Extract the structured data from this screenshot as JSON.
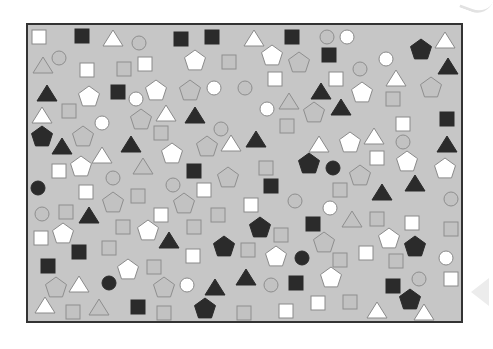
{
  "frame": {
    "x": 27,
    "y": 24,
    "width": 435,
    "height": 298,
    "background": "#c6c6c6",
    "border": "#333333"
  },
  "colors": {
    "black": "#2b2b2b",
    "gray": "#c2c2c2",
    "gray_stroke": "#8e8e8e",
    "white": "#ffffff",
    "white_stroke": "#8a8a8a"
  },
  "shapes": [
    {
      "t": "sq",
      "c": "white",
      "x": 39,
      "y": 37
    },
    {
      "t": "sq",
      "c": "black",
      "x": 82,
      "y": 36
    },
    {
      "t": "tri",
      "c": "white",
      "x": 113,
      "y": 39
    },
    {
      "t": "circ",
      "c": "gray",
      "x": 139,
      "y": 43
    },
    {
      "t": "sq",
      "c": "black",
      "x": 181,
      "y": 39
    },
    {
      "t": "sq",
      "c": "black",
      "x": 212,
      "y": 37
    },
    {
      "t": "tri",
      "c": "white",
      "x": 254,
      "y": 39
    },
    {
      "t": "sq",
      "c": "black",
      "x": 292,
      "y": 37
    },
    {
      "t": "circ",
      "c": "gray",
      "x": 327,
      "y": 37
    },
    {
      "t": "circ",
      "c": "white",
      "x": 347,
      "y": 37
    },
    {
      "t": "pent",
      "c": "black",
      "x": 421,
      "y": 50
    },
    {
      "t": "tri",
      "c": "white",
      "x": 445,
      "y": 41
    },
    {
      "t": "tri",
      "c": "gray",
      "x": 43,
      "y": 66
    },
    {
      "t": "circ",
      "c": "gray",
      "x": 59,
      "y": 58
    },
    {
      "t": "sq",
      "c": "white",
      "x": 87,
      "y": 70
    },
    {
      "t": "sq",
      "c": "gray",
      "x": 124,
      "y": 69
    },
    {
      "t": "sq",
      "c": "white",
      "x": 145,
      "y": 64
    },
    {
      "t": "pent",
      "c": "white",
      "x": 195,
      "y": 61
    },
    {
      "t": "sq",
      "c": "gray",
      "x": 229,
      "y": 62
    },
    {
      "t": "pent",
      "c": "white",
      "x": 272,
      "y": 56
    },
    {
      "t": "pent",
      "c": "gray",
      "x": 299,
      "y": 63
    },
    {
      "t": "sq",
      "c": "black",
      "x": 329,
      "y": 55
    },
    {
      "t": "circ",
      "c": "gray",
      "x": 360,
      "y": 69
    },
    {
      "t": "circ",
      "c": "white",
      "x": 386,
      "y": 59
    },
    {
      "t": "tri",
      "c": "black",
      "x": 448,
      "y": 67
    },
    {
      "t": "tri",
      "c": "black",
      "x": 47,
      "y": 94
    },
    {
      "t": "pent",
      "c": "white",
      "x": 89,
      "y": 97
    },
    {
      "t": "sq",
      "c": "black",
      "x": 118,
      "y": 92
    },
    {
      "t": "circ",
      "c": "white",
      "x": 136,
      "y": 99
    },
    {
      "t": "pent",
      "c": "white",
      "x": 156,
      "y": 91
    },
    {
      "t": "pent",
      "c": "gray",
      "x": 190,
      "y": 91
    },
    {
      "t": "circ",
      "c": "white",
      "x": 214,
      "y": 88
    },
    {
      "t": "circ",
      "c": "gray",
      "x": 245,
      "y": 88
    },
    {
      "t": "sq",
      "c": "white",
      "x": 275,
      "y": 79
    },
    {
      "t": "sq",
      "c": "white",
      "x": 336,
      "y": 79
    },
    {
      "t": "tri",
      "c": "white",
      "x": 396,
      "y": 79
    },
    {
      "t": "pent",
      "c": "white",
      "x": 362,
      "y": 93
    },
    {
      "t": "pent",
      "c": "gray",
      "x": 431,
      "y": 88
    },
    {
      "t": "tri",
      "c": "black",
      "x": 321,
      "y": 92
    },
    {
      "t": "tri",
      "c": "gray",
      "x": 289,
      "y": 102
    },
    {
      "t": "circ",
      "c": "white",
      "x": 267,
      "y": 109
    },
    {
      "t": "pent",
      "c": "gray",
      "x": 314,
      "y": 113
    },
    {
      "t": "tri",
      "c": "black",
      "x": 341,
      "y": 108
    },
    {
      "t": "sq",
      "c": "gray",
      "x": 393,
      "y": 99
    },
    {
      "t": "tri",
      "c": "white",
      "x": 42,
      "y": 116
    },
    {
      "t": "sq",
      "c": "gray",
      "x": 69,
      "y": 111
    },
    {
      "t": "circ",
      "c": "white",
      "x": 102,
      "y": 123
    },
    {
      "t": "pent",
      "c": "gray",
      "x": 141,
      "y": 120
    },
    {
      "t": "tri",
      "c": "white",
      "x": 166,
      "y": 114
    },
    {
      "t": "tri",
      "c": "black",
      "x": 195,
      "y": 116
    },
    {
      "t": "sq",
      "c": "gray",
      "x": 161,
      "y": 133
    },
    {
      "t": "circ",
      "c": "gray",
      "x": 221,
      "y": 129
    },
    {
      "t": "sq",
      "c": "gray",
      "x": 287,
      "y": 126
    },
    {
      "t": "sq",
      "c": "white",
      "x": 403,
      "y": 124
    },
    {
      "t": "sq",
      "c": "black",
      "x": 447,
      "y": 119
    },
    {
      "t": "pent",
      "c": "black",
      "x": 42,
      "y": 137
    },
    {
      "t": "tri",
      "c": "black",
      "x": 62,
      "y": 147
    },
    {
      "t": "pent",
      "c": "gray",
      "x": 83,
      "y": 137
    },
    {
      "t": "tri",
      "c": "black",
      "x": 131,
      "y": 145
    },
    {
      "t": "tri",
      "c": "white",
      "x": 231,
      "y": 144
    },
    {
      "t": "pent",
      "c": "gray",
      "x": 207,
      "y": 147
    },
    {
      "t": "tri",
      "c": "black",
      "x": 256,
      "y": 140
    },
    {
      "t": "tri",
      "c": "white",
      "x": 319,
      "y": 145
    },
    {
      "t": "pent",
      "c": "white",
      "x": 350,
      "y": 143
    },
    {
      "t": "tri",
      "c": "white",
      "x": 374,
      "y": 137
    },
    {
      "t": "circ",
      "c": "gray",
      "x": 403,
      "y": 142
    },
    {
      "t": "tri",
      "c": "black",
      "x": 447,
      "y": 145
    },
    {
      "t": "sq",
      "c": "white",
      "x": 59,
      "y": 171
    },
    {
      "t": "pent",
      "c": "white",
      "x": 81,
      "y": 167
    },
    {
      "t": "tri",
      "c": "white",
      "x": 102,
      "y": 156
    },
    {
      "t": "tri",
      "c": "gray",
      "x": 143,
      "y": 167
    },
    {
      "t": "pent",
      "c": "white",
      "x": 172,
      "y": 154
    },
    {
      "t": "sq",
      "c": "black",
      "x": 194,
      "y": 171
    },
    {
      "t": "pent",
      "c": "gray",
      "x": 228,
      "y": 178
    },
    {
      "t": "sq",
      "c": "gray",
      "x": 266,
      "y": 168
    },
    {
      "t": "pent",
      "c": "black",
      "x": 309,
      "y": 164
    },
    {
      "t": "circ",
      "c": "black",
      "x": 333,
      "y": 168
    },
    {
      "t": "sq",
      "c": "white",
      "x": 377,
      "y": 158
    },
    {
      "t": "pent",
      "c": "gray",
      "x": 360,
      "y": 176
    },
    {
      "t": "pent",
      "c": "white",
      "x": 407,
      "y": 162
    },
    {
      "t": "pent",
      "c": "white",
      "x": 445,
      "y": 169
    },
    {
      "t": "circ",
      "c": "black",
      "x": 38,
      "y": 188
    },
    {
      "t": "circ",
      "c": "gray",
      "x": 113,
      "y": 178
    },
    {
      "t": "sq",
      "c": "white",
      "x": 86,
      "y": 192
    },
    {
      "t": "circ",
      "c": "gray",
      "x": 173,
      "y": 185
    },
    {
      "t": "sq",
      "c": "white",
      "x": 204,
      "y": 190
    },
    {
      "t": "sq",
      "c": "black",
      "x": 271,
      "y": 186
    },
    {
      "t": "sq",
      "c": "gray",
      "x": 340,
      "y": 190
    },
    {
      "t": "tri",
      "c": "black",
      "x": 382,
      "y": 193
    },
    {
      "t": "tri",
      "c": "black",
      "x": 415,
      "y": 184
    },
    {
      "t": "circ",
      "c": "gray",
      "x": 451,
      "y": 199
    },
    {
      "t": "pent",
      "c": "gray",
      "x": 113,
      "y": 203
    },
    {
      "t": "sq",
      "c": "gray",
      "x": 138,
      "y": 196
    },
    {
      "t": "pent",
      "c": "gray",
      "x": 184,
      "y": 204
    },
    {
      "t": "sq",
      "c": "white",
      "x": 251,
      "y": 205
    },
    {
      "t": "circ",
      "c": "gray",
      "x": 295,
      "y": 201
    },
    {
      "t": "circ",
      "c": "white",
      "x": 330,
      "y": 208
    },
    {
      "t": "circ",
      "c": "gray",
      "x": 42,
      "y": 214
    },
    {
      "t": "sq",
      "c": "gray",
      "x": 66,
      "y": 212
    },
    {
      "t": "tri",
      "c": "black",
      "x": 89,
      "y": 216
    },
    {
      "t": "sq",
      "c": "white",
      "x": 161,
      "y": 215
    },
    {
      "t": "sq",
      "c": "gray",
      "x": 218,
      "y": 215
    },
    {
      "t": "sq",
      "c": "black",
      "x": 313,
      "y": 224
    },
    {
      "t": "tri",
      "c": "gray",
      "x": 352,
      "y": 220
    },
    {
      "t": "sq",
      "c": "gray",
      "x": 377,
      "y": 219
    },
    {
      "t": "sq",
      "c": "white",
      "x": 412,
      "y": 223
    },
    {
      "t": "sq",
      "c": "gray",
      "x": 451,
      "y": 229
    },
    {
      "t": "sq",
      "c": "white",
      "x": 41,
      "y": 238
    },
    {
      "t": "pent",
      "c": "white",
      "x": 63,
      "y": 234
    },
    {
      "t": "sq",
      "c": "black",
      "x": 79,
      "y": 252
    },
    {
      "t": "sq",
      "c": "gray",
      "x": 123,
      "y": 227
    },
    {
      "t": "pent",
      "c": "white",
      "x": 148,
      "y": 231
    },
    {
      "t": "tri",
      "c": "black",
      "x": 169,
      "y": 241
    },
    {
      "t": "sq",
      "c": "gray",
      "x": 194,
      "y": 227
    },
    {
      "t": "pent",
      "c": "black",
      "x": 224,
      "y": 247
    },
    {
      "t": "pent",
      "c": "black",
      "x": 260,
      "y": 228
    },
    {
      "t": "sq",
      "c": "gray",
      "x": 281,
      "y": 235
    },
    {
      "t": "pent",
      "c": "gray",
      "x": 324,
      "y": 243
    },
    {
      "t": "sq",
      "c": "white",
      "x": 366,
      "y": 253
    },
    {
      "t": "pent",
      "c": "white",
      "x": 389,
      "y": 239
    },
    {
      "t": "pent",
      "c": "black",
      "x": 415,
      "y": 247
    },
    {
      "t": "sq",
      "c": "gray",
      "x": 109,
      "y": 248
    },
    {
      "t": "sq",
      "c": "black",
      "x": 48,
      "y": 266
    },
    {
      "t": "sq",
      "c": "white",
      "x": 193,
      "y": 256
    },
    {
      "t": "sq",
      "c": "gray",
      "x": 248,
      "y": 250
    },
    {
      "t": "pent",
      "c": "white",
      "x": 276,
      "y": 257
    },
    {
      "t": "circ",
      "c": "black",
      "x": 302,
      "y": 258
    },
    {
      "t": "sq",
      "c": "gray",
      "x": 340,
      "y": 260
    },
    {
      "t": "sq",
      "c": "gray",
      "x": 396,
      "y": 261
    },
    {
      "t": "circ",
      "c": "white",
      "x": 446,
      "y": 258
    },
    {
      "t": "pent",
      "c": "white",
      "x": 128,
      "y": 270
    },
    {
      "t": "sq",
      "c": "gray",
      "x": 154,
      "y": 267
    },
    {
      "t": "pent",
      "c": "gray",
      "x": 56,
      "y": 288
    },
    {
      "t": "tri",
      "c": "white",
      "x": 79,
      "y": 285
    },
    {
      "t": "circ",
      "c": "black",
      "x": 109,
      "y": 283
    },
    {
      "t": "pent",
      "c": "gray",
      "x": 164,
      "y": 288
    },
    {
      "t": "circ",
      "c": "white",
      "x": 187,
      "y": 285
    },
    {
      "t": "tri",
      "c": "black",
      "x": 215,
      "y": 288
    },
    {
      "t": "tri",
      "c": "black",
      "x": 246,
      "y": 278
    },
    {
      "t": "circ",
      "c": "gray",
      "x": 271,
      "y": 285
    },
    {
      "t": "sq",
      "c": "black",
      "x": 296,
      "y": 283
    },
    {
      "t": "pent",
      "c": "white",
      "x": 331,
      "y": 278
    },
    {
      "t": "sq",
      "c": "black",
      "x": 393,
      "y": 286
    },
    {
      "t": "circ",
      "c": "gray",
      "x": 419,
      "y": 279
    },
    {
      "t": "sq",
      "c": "white",
      "x": 451,
      "y": 279
    },
    {
      "t": "tri",
      "c": "white",
      "x": 45,
      "y": 306
    },
    {
      "t": "sq",
      "c": "gray",
      "x": 73,
      "y": 312
    },
    {
      "t": "tri",
      "c": "gray",
      "x": 99,
      "y": 308
    },
    {
      "t": "sq",
      "c": "black",
      "x": 138,
      "y": 307
    },
    {
      "t": "sq",
      "c": "gray",
      "x": 164,
      "y": 313
    },
    {
      "t": "pent",
      "c": "black",
      "x": 205,
      "y": 309
    },
    {
      "t": "sq",
      "c": "gray",
      "x": 244,
      "y": 313
    },
    {
      "t": "sq",
      "c": "white",
      "x": 286,
      "y": 311
    },
    {
      "t": "sq",
      "c": "white",
      "x": 318,
      "y": 303
    },
    {
      "t": "sq",
      "c": "gray",
      "x": 350,
      "y": 302
    },
    {
      "t": "tri",
      "c": "white",
      "x": 377,
      "y": 311
    },
    {
      "t": "pent",
      "c": "black",
      "x": 410,
      "y": 300
    },
    {
      "t": "tri",
      "c": "white",
      "x": 424,
      "y": 313
    }
  ]
}
